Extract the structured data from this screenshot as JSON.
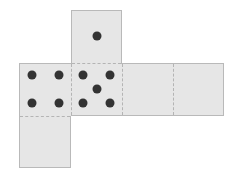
{
  "diagram": {
    "type": "cube-net",
    "face_color": "#e6e6e6",
    "border_color": "#b9b9b9",
    "fold_line_style": "dashed",
    "pip_color": "#333333",
    "faces": [
      {
        "id": "top",
        "pips": 1
      },
      {
        "id": "left",
        "pips": 4
      },
      {
        "id": "center",
        "pips": 5
      },
      {
        "id": "right",
        "pips": 0
      },
      {
        "id": "far-right",
        "pips": 0
      },
      {
        "id": "bottom",
        "pips": 0
      }
    ]
  }
}
